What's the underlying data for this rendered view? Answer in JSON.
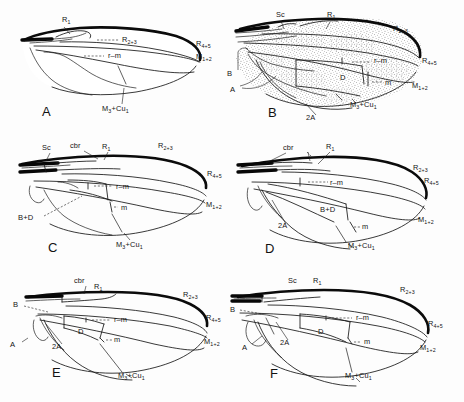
{
  "figure": {
    "panel_count": 6,
    "background_color": "#fdfdfd",
    "ink_color": "#161616"
  },
  "panels": [
    {
      "letter": "A",
      "letter_pos": [
        42,
        116
      ],
      "origin": [
        10,
        6
      ],
      "shaded": false,
      "labels": [
        {
          "name": "r1",
          "text": "R",
          "sub": "1",
          "x": 62,
          "y": 22
        },
        {
          "name": "r23",
          "text": "R",
          "sub": "2+3",
          "x": 122,
          "y": 42
        },
        {
          "name": "rm",
          "text": "r–m",
          "sub": "",
          "x": 108,
          "y": 58
        },
        {
          "name": "r45",
          "text": "R",
          "sub": "4+5",
          "x": 196,
          "y": 46
        },
        {
          "name": "m12",
          "text": "M",
          "sub": "1+2",
          "x": 196,
          "y": 59
        },
        {
          "name": "m3cu1",
          "text": "M",
          "sub": "3",
          "text2": "+Cu",
          "sub2": "1",
          "x": 106,
          "y": 111
        }
      ]
    },
    {
      "letter": "B",
      "letter_pos": [
        268,
        117
      ],
      "origin": [
        232,
        6
      ],
      "shaded": true,
      "labels": [
        {
          "name": "sc",
          "text": "Sc",
          "sub": "",
          "x": 276,
          "y": 17
        },
        {
          "name": "r1",
          "text": "R",
          "sub": "1",
          "x": 327,
          "y": 17
        },
        {
          "name": "r23",
          "text": "R",
          "sub": "2+3",
          "x": 393,
          "y": 31
        },
        {
          "name": "b-cell",
          "text": "B",
          "sub": "",
          "x": 229,
          "y": 75
        },
        {
          "name": "a-cell",
          "text": "A",
          "sub": "",
          "x": 232,
          "y": 90
        },
        {
          "name": "rm",
          "text": "r–m",
          "sub": "",
          "x": 348,
          "y": 62
        },
        {
          "name": "d-cell",
          "text": "D",
          "sub": "",
          "x": 342,
          "y": 78
        },
        {
          "name": "m",
          "text": "m",
          "sub": "",
          "x": 375,
          "y": 83
        },
        {
          "name": "r45",
          "text": "R",
          "sub": "4+5",
          "x": 425,
          "y": 62
        },
        {
          "name": "m12",
          "text": "M",
          "sub": "1+2",
          "x": 415,
          "y": 87
        },
        {
          "name": "2a",
          "text": "2A",
          "sub": "",
          "x": 310,
          "y": 118
        },
        {
          "name": "m3cu1",
          "text": "M",
          "sub": "3",
          "text2": "+Cu",
          "sub2": "1",
          "x": 358,
          "y": 106
        }
      ]
    },
    {
      "letter": "C",
      "letter_pos": [
        48,
        252
      ],
      "origin": [
        10,
        138
      ],
      "shaded": false,
      "labels": [
        {
          "name": "sc",
          "text": "Sc",
          "sub": "",
          "x": 46,
          "y": 150
        },
        {
          "name": "cbr",
          "text": "cbr",
          "sub": "",
          "x": 75,
          "y": 148
        },
        {
          "name": "r1",
          "text": "R",
          "sub": "1",
          "x": 104,
          "y": 149
        },
        {
          "name": "r23",
          "text": "R",
          "sub": "2+3",
          "x": 160,
          "y": 148
        },
        {
          "name": "r45",
          "text": "R",
          "sub": "4+5",
          "x": 207,
          "y": 172
        },
        {
          "name": "rm",
          "text": "r–m",
          "sub": "",
          "x": 115,
          "y": 188
        },
        {
          "name": "m",
          "text": "m",
          "sub": "",
          "x": 118,
          "y": 209
        },
        {
          "name": "m12",
          "text": "M",
          "sub": "1+2",
          "x": 206,
          "y": 205
        },
        {
          "name": "bd-cell",
          "text": "B+D",
          "sub": "",
          "x": 22,
          "y": 219
        },
        {
          "name": "m3cu1",
          "text": "M",
          "sub": "3",
          "text2": "+Cu",
          "sub2": "1",
          "x": 120,
          "y": 245
        }
      ]
    },
    {
      "letter": "D",
      "letter_pos": [
        265,
        253
      ],
      "origin": [
        232,
        138
      ],
      "shaded": false,
      "labels": [
        {
          "name": "cbr",
          "text": "cbr",
          "sub": "",
          "x": 287,
          "y": 150
        },
        {
          "name": "r1",
          "text": "R",
          "sub": "1",
          "x": 327,
          "y": 149
        },
        {
          "name": "r23",
          "text": "R",
          "sub": "2+3",
          "x": 415,
          "y": 167
        },
        {
          "name": "r45",
          "text": "R",
          "sub": "4+5",
          "x": 425,
          "y": 180
        },
        {
          "name": "rm",
          "text": "r–m",
          "sub": "",
          "x": 330,
          "y": 192
        },
        {
          "name": "bd-cell",
          "text": "B+D",
          "sub": "",
          "x": 325,
          "y": 211
        },
        {
          "name": "m",
          "text": "m",
          "sub": "",
          "x": 358,
          "y": 224
        },
        {
          "name": "m12",
          "text": "M",
          "sub": "1+2",
          "x": 419,
          "y": 220
        },
        {
          "name": "2a",
          "text": "2A",
          "sub": "",
          "x": 283,
          "y": 226
        },
        {
          "name": "m3cu1",
          "text": "M",
          "sub": "3",
          "text2": "+Cu",
          "sub2": "1",
          "x": 350,
          "y": 245
        }
      ]
    },
    {
      "letter": "E",
      "letter_pos": [
        52,
        377
      ],
      "origin": [
        10,
        272
      ],
      "shaded": false,
      "labels": [
        {
          "name": "cbr",
          "text": "cbr",
          "sub": "",
          "x": 78,
          "y": 283
        },
        {
          "name": "r1",
          "text": "R",
          "sub": "1",
          "x": 96,
          "y": 288
        },
        {
          "name": "r23",
          "text": "R",
          "sub": "2+3",
          "x": 185,
          "y": 296
        },
        {
          "name": "b-cell",
          "text": "B",
          "sub": "",
          "x": 15,
          "y": 305
        },
        {
          "name": "rm",
          "text": "r–m",
          "sub": "",
          "x": 100,
          "y": 320
        },
        {
          "name": "r45",
          "text": "R",
          "sub": "4+5",
          "x": 207,
          "y": 317
        },
        {
          "name": "d-cell",
          "text": "D",
          "sub": "",
          "x": 82,
          "y": 333
        },
        {
          "name": "m",
          "text": "m",
          "sub": "",
          "x": 106,
          "y": 337
        },
        {
          "name": "a-cell",
          "text": "A",
          "sub": "",
          "x": 12,
          "y": 344
        },
        {
          "name": "2a",
          "text": "2A",
          "sub": "",
          "x": 56,
          "y": 347
        },
        {
          "name": "m12",
          "text": "M",
          "sub": "1+2",
          "x": 205,
          "y": 341
        },
        {
          "name": "m3cu1",
          "text": "M",
          "sub": "3",
          "text2": "+Cu",
          "sub2": "1",
          "x": 122,
          "y": 376
        }
      ]
    },
    {
      "letter": "F",
      "letter_pos": [
        270,
        378
      ],
      "origin": [
        232,
        272
      ],
      "shaded": false,
      "labels": [
        {
          "name": "sc",
          "text": "Sc",
          "sub": "",
          "x": 292,
          "y": 283
        },
        {
          "name": "r1",
          "text": "R",
          "sub": "1",
          "x": 317,
          "y": 283
        },
        {
          "name": "r23",
          "text": "R",
          "sub": "2+3",
          "x": 403,
          "y": 291
        },
        {
          "name": "b-cell",
          "text": "B",
          "sub": "",
          "x": 232,
          "y": 310
        },
        {
          "name": "rm",
          "text": "r–m",
          "sub": "",
          "x": 340,
          "y": 320
        },
        {
          "name": "d-cell",
          "text": "D",
          "sub": "",
          "x": 322,
          "y": 333
        },
        {
          "name": "r45",
          "text": "R",
          "sub": "4+5",
          "x": 430,
          "y": 323
        },
        {
          "name": "m",
          "text": "m",
          "sub": "",
          "x": 357,
          "y": 340
        },
        {
          "name": "a-cell",
          "text": "A",
          "sub": "",
          "x": 245,
          "y": 348
        },
        {
          "name": "2a",
          "text": "2A",
          "sub": "",
          "x": 285,
          "y": 343
        },
        {
          "name": "m12",
          "text": "M",
          "sub": "1+2",
          "x": 422,
          "y": 347
        },
        {
          "name": "m3cu1",
          "text": "M",
          "sub": "3",
          "text2": "+Cu",
          "sub2": "1",
          "x": 348,
          "y": 376
        }
      ]
    }
  ]
}
